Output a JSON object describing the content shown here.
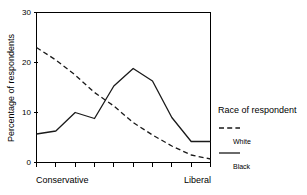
{
  "chart_data": {
    "type": "line",
    "title": "",
    "xlabel": "",
    "ylabel": "Percentage of respondents",
    "ylim": [
      0,
      30
    ],
    "yticks": [
      0,
      10,
      20,
      30
    ],
    "ytick_labels": [
      "0",
      "10",
      "20",
      "30"
    ],
    "grid": false,
    "x": [
      1,
      2,
      3,
      4,
      5,
      6,
      7,
      8,
      9,
      10
    ],
    "x_axis_left_label": "Conservative",
    "x_axis_right_label": "Liberal",
    "xtick_count": 10,
    "legend": {
      "title": "Race of respondent",
      "position": "right",
      "entries": [
        {
          "name": "White",
          "style": "dashed"
        },
        {
          "name": "Black",
          "style": "solid"
        }
      ]
    },
    "series": [
      {
        "name": "White",
        "style": "dashed",
        "color": "#1a1a1a",
        "values": [
          23.0,
          20.5,
          17.5,
          14.0,
          11.3,
          8.0,
          5.5,
          3.3,
          1.5,
          0.7
        ]
      },
      {
        "name": "Black",
        "style": "solid",
        "color": "#1a1a1a",
        "values": [
          5.7,
          6.3,
          10.0,
          8.8,
          15.3,
          18.8,
          16.3,
          9.0,
          4.2,
          4.2
        ]
      }
    ]
  },
  "axes": {
    "y_axis_title": "Percentage of respondents",
    "y_tick_0": "0",
    "y_tick_10": "10",
    "y_tick_20": "20",
    "y_tick_30": "30",
    "x_left_category": "Conservative",
    "x_right_category": "Liberal"
  },
  "legend": {
    "title": "Race of respondent",
    "white_label": "White",
    "black_label": "Black"
  },
  "colors": {
    "line": "#1a1a1a",
    "axis": "#000000",
    "background": "#ffffff"
  }
}
